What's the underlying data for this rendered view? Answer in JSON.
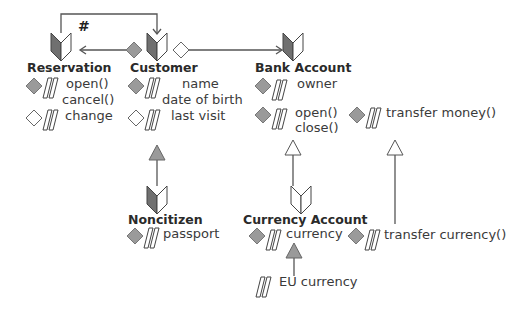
{
  "diagram": {
    "colors": {
      "line": "#555555",
      "fill_gray": "#9a9a9a",
      "book_dark": "#6f6f6f",
      "white": "#ffffff"
    },
    "connector_label": "#",
    "classes": [
      {
        "id": "reservation",
        "title": "Reservation",
        "rows": [
          {
            "visibility": "public",
            "icon": "gray-diamond-icon",
            "lines": [
              "open()",
              "cancel()"
            ]
          },
          {
            "visibility": "private",
            "icon": "white-diamond-icon",
            "lines": [
              "change"
            ]
          }
        ]
      },
      {
        "id": "customer",
        "title": "Customer",
        "rows": [
          {
            "visibility": "public",
            "icon": "gray-diamond-icon",
            "lines": [
              "name",
              "date of birth"
            ]
          },
          {
            "visibility": "private",
            "icon": "white-diamond-icon",
            "lines": [
              "last visit"
            ]
          }
        ]
      },
      {
        "id": "bank-account",
        "title": "Bank Account",
        "rows": [
          {
            "visibility": "public",
            "icon": "gray-diamond-icon",
            "lines": [
              "owner"
            ]
          },
          {
            "visibility": "public",
            "icon": "gray-diamond-icon",
            "lines": [
              "open()",
              "close()"
            ]
          }
        ]
      },
      {
        "id": "transfer-money",
        "title": "",
        "rows": [
          {
            "visibility": "public",
            "icon": "gray-diamond-icon",
            "lines": [
              "transfer money()"
            ]
          }
        ]
      },
      {
        "id": "noncitizen",
        "title": "Noncitizen",
        "rows": [
          {
            "visibility": "public",
            "icon": "gray-diamond-icon",
            "lines": [
              "passport"
            ]
          }
        ]
      },
      {
        "id": "currency-account",
        "title": "Currency Account",
        "rows": [
          {
            "visibility": "public",
            "icon": "gray-diamond-icon",
            "lines": [
              "currency"
            ]
          }
        ]
      },
      {
        "id": "transfer-currency",
        "title": "",
        "rows": [
          {
            "visibility": "public",
            "icon": "gray-diamond-icon",
            "lines": [
              "transfer currency()"
            ]
          }
        ]
      },
      {
        "id": "eu-currency",
        "title": "",
        "rows": [
          {
            "visibility": "none",
            "icon": "parallelogram-icon",
            "lines": [
              "EU currency"
            ]
          }
        ]
      }
    ]
  }
}
